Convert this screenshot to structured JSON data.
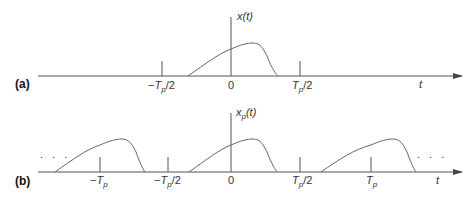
{
  "panel_a": {
    "label": "(a)",
    "signal_label": "x(t)",
    "signal_name": "x",
    "axis_var": "t",
    "ticks": [
      {
        "label_prefix": "−",
        "label_T": "T",
        "label_sub": "p",
        "label_suffix": "/2"
      },
      {
        "label": "0"
      },
      {
        "label_prefix": "",
        "label_T": "T",
        "label_sub": "p",
        "label_suffix": "/2"
      }
    ]
  },
  "panel_b": {
    "label": "(b)",
    "signal_name": "x",
    "signal_sub": "p",
    "signal_arg": "(t)",
    "axis_var": "t",
    "ellipsis_left": ". . .",
    "ellipsis_right": ". . .",
    "ticks": [
      {
        "label_prefix": "−",
        "label_T": "T",
        "label_sub": "p",
        "label_suffix": ""
      },
      {
        "label_prefix": "−",
        "label_T": "T",
        "label_sub": "p",
        "label_suffix": "/2"
      },
      {
        "label": "0"
      },
      {
        "label_prefix": "",
        "label_T": "T",
        "label_sub": "p",
        "label_suffix": "/2"
      },
      {
        "label_prefix": "",
        "label_T": "T",
        "label_sub": "p",
        "label_suffix": ""
      }
    ]
  }
}
